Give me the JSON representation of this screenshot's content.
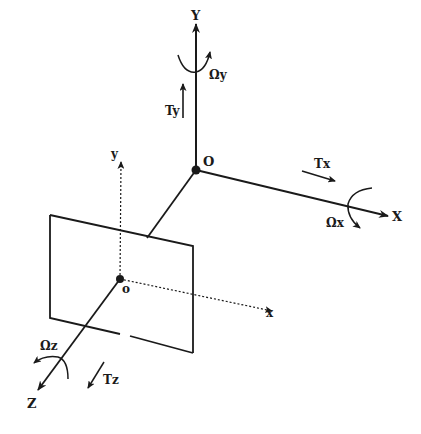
{
  "diagram": {
    "world_axes": {
      "origin_label": "O",
      "x_label": "X",
      "y_label": "Y",
      "z_label": "Z"
    },
    "camera_axes": {
      "origin_label": "o",
      "x_label": "x",
      "y_label": "y"
    },
    "translations": {
      "tx": "Tx",
      "ty": "Ty",
      "tz": "Tz"
    },
    "rotations": {
      "omega_x": "Ωx",
      "omega_y": "Ωy",
      "omega_z": "Ωz"
    },
    "colors": {
      "ink": "#1a1a1a",
      "background": "#ffffff"
    }
  }
}
